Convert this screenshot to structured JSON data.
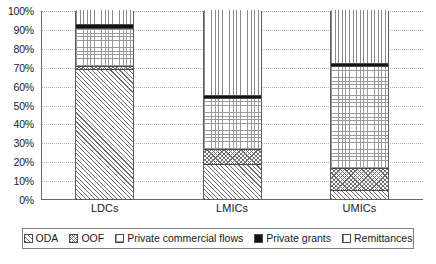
{
  "chart_data": {
    "type": "bar",
    "stacked": true,
    "stack_mode": "percent",
    "title": "",
    "subtitle": "",
    "xlabel": "",
    "ylabel": "",
    "ylim": [
      0,
      100
    ],
    "yticks": [
      0,
      10,
      20,
      30,
      40,
      50,
      60,
      70,
      80,
      90,
      100
    ],
    "ytick_labels": [
      "0%",
      "10%",
      "20%",
      "30%",
      "40%",
      "50%",
      "60%",
      "70%",
      "80%",
      "90%",
      "100%"
    ],
    "grid": true,
    "grid_axis": "y",
    "legend_position": "bottom",
    "categories": [
      "LDCs",
      "LMICs",
      "UMICs"
    ],
    "series": [
      {
        "name": "ODA",
        "pattern": "diagonal-hatch",
        "values": [
          68,
          18,
          4
        ]
      },
      {
        "name": "OOF",
        "pattern": "cross-hatch",
        "values": [
          2,
          8,
          12
        ]
      },
      {
        "name": "Private commercial flows",
        "pattern": "fine-grid",
        "values": [
          20,
          27,
          54
        ]
      },
      {
        "name": "Private grants",
        "pattern": "solid-black",
        "values": [
          2,
          1.5,
          1.5
        ]
      },
      {
        "name": "Remittances",
        "pattern": "vertical-lines",
        "values": [
          8,
          45.5,
          28.5
        ]
      }
    ]
  },
  "axis": {
    "y_tick_labels": [
      "100%",
      "90%",
      "80%",
      "70%",
      "60%",
      "50%",
      "40%",
      "30%",
      "20%",
      "10%",
      "0%"
    ],
    "x_tick_labels": [
      "LDCs",
      "LMICs",
      "UMICs"
    ]
  },
  "legend": {
    "items": [
      {
        "label": "ODA",
        "pattern": "diagonal-hatch"
      },
      {
        "label": "OOF",
        "pattern": "cross-hatch"
      },
      {
        "label": "Private commercial flows",
        "pattern": "fine-grid"
      },
      {
        "label": "Private grants",
        "pattern": "solid-black"
      },
      {
        "label": "Remittances",
        "pattern": "vertical-lines"
      }
    ]
  },
  "colors": {
    "axis_line": "#6b6b6b",
    "gridline": "#b9b9b9",
    "bar_border": "#5d5d5d",
    "hatch": "#6f6f6f",
    "black_segment": "#131313",
    "background": "#ffffff"
  }
}
